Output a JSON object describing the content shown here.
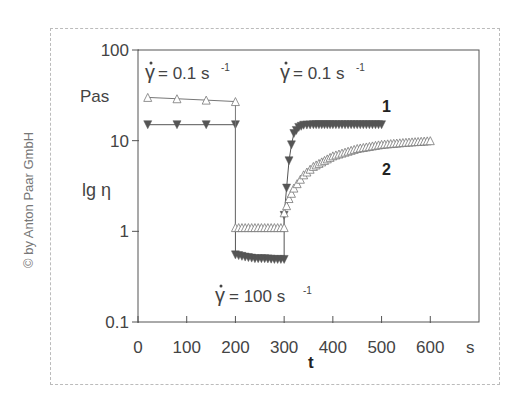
{
  "copyright": "© by Anton Paar GmbH",
  "chart_data": {
    "type": "scatter",
    "title": "",
    "xlabel": "t",
    "x_unit": "s",
    "ylabel": "lg η",
    "y_unit": "Pas",
    "yscale": "log",
    "xlim": [
      0,
      700
    ],
    "ylim": [
      0.1,
      100
    ],
    "x_ticks": [
      0,
      100,
      200,
      300,
      400,
      500,
      600
    ],
    "x_tick_labels": [
      "0",
      "100",
      "200",
      "300",
      "400",
      "500",
      "600"
    ],
    "y_ticks": [
      0.1,
      1,
      10,
      100
    ],
    "y_tick_labels": [
      "0.1",
      "1",
      "10",
      "100"
    ],
    "grid": false,
    "annotations": [
      {
        "text": "γ̇ = 0.1 s⁻¹",
        "phase": "rest (0–200 s)"
      },
      {
        "text": "γ̇ = 100 s⁻¹",
        "phase": "high shear (200–300 s)"
      },
      {
        "text": "γ̇ = 0.1 s⁻¹",
        "phase": "recovery (300–600 s)"
      }
    ],
    "series": [
      {
        "name": "1",
        "marker": "filled-down-triangle",
        "color": "#555555",
        "x": [
          20,
          80,
          140,
          200,
          200,
          220,
          240,
          260,
          280,
          300,
          300,
          305,
          310,
          315,
          320,
          330,
          340,
          360,
          400,
          450,
          500
        ],
        "y": [
          15,
          15,
          15,
          15,
          0.55,
          0.52,
          0.5,
          0.5,
          0.49,
          0.49,
          1.5,
          3,
          6,
          9,
          12,
          14,
          14.8,
          15,
          15,
          15,
          15
        ]
      },
      {
        "name": "2",
        "marker": "open-up-triangle",
        "color": "#777777",
        "x": [
          20,
          80,
          140,
          200,
          200,
          220,
          240,
          260,
          280,
          300,
          300,
          310,
          320,
          340,
          360,
          400,
          450,
          500,
          550,
          600
        ],
        "y": [
          30,
          29,
          28,
          27,
          1.1,
          1.1,
          1.1,
          1.1,
          1.1,
          1.1,
          1.6,
          2.3,
          3.0,
          4.2,
          5.2,
          6.8,
          8.2,
          9.1,
          9.6,
          10
        ]
      }
    ]
  },
  "labels": {
    "y_unit": "Pas",
    "y_axis": "lg η",
    "x_axis": "t",
    "x_unit": "s",
    "gamma_rest": "= 0.1 s",
    "gamma_high": "= 100 s",
    "gamma_recovery": "= 0.1 s",
    "exp": "-1",
    "series1_label": "1",
    "series2_label": "2"
  }
}
